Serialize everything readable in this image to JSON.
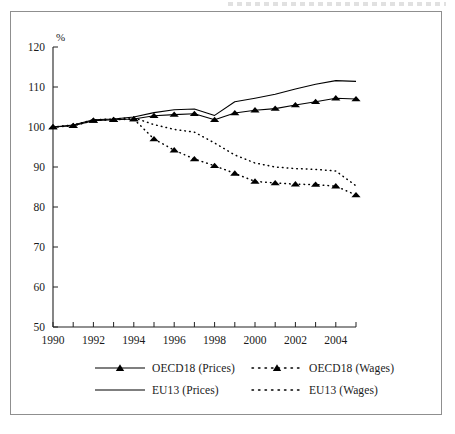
{
  "figure": {
    "y_axis_title": "%"
  },
  "chart_data": {
    "type": "line",
    "title": "",
    "xlabel": "",
    "ylabel": "%",
    "ylim": [
      50,
      120
    ],
    "yticks": [
      50,
      60,
      70,
      80,
      90,
      100,
      110,
      120
    ],
    "xlim": [
      1990,
      2005
    ],
    "xticks": [
      1990,
      1992,
      1994,
      1996,
      1998,
      2000,
      2002,
      2004
    ],
    "xticklabels": [
      "1990",
      "1992",
      "1994",
      "1996",
      "1998",
      "2000",
      "2002",
      "2004"
    ],
    "minor_xticks": [
      1991,
      1993,
      1995,
      1997,
      1999,
      2001,
      2003,
      2005
    ],
    "grid": false,
    "legend_position": "below-axes",
    "x": [
      1990,
      1991,
      1992,
      1993,
      1994,
      1995,
      1996,
      1997,
      1998,
      1999,
      2000,
      2001,
      2002,
      2003,
      2004,
      2005
    ],
    "series": [
      {
        "name": "OECD18 (Prices)",
        "style": "solid-with-markers",
        "marker": "triangle",
        "color": "#000000",
        "values": [
          100.0,
          100.3,
          101.6,
          101.8,
          102.0,
          102.8,
          103.1,
          103.3,
          101.8,
          103.5,
          104.2,
          104.6,
          105.5,
          106.3,
          107.2,
          107.0
        ]
      },
      {
        "name": "EU13 (Prices)",
        "style": "solid",
        "marker": "none",
        "color": "#000000",
        "values": [
          100.0,
          100.5,
          101.8,
          102.0,
          102.5,
          103.6,
          104.3,
          104.5,
          102.9,
          106.3,
          107.2,
          108.2,
          109.5,
          110.7,
          111.6,
          111.4
        ]
      },
      {
        "name": "OECD18 (Wages)",
        "style": "dotted-with-markers",
        "marker": "triangle",
        "color": "#000000",
        "values": [
          100.0,
          100.3,
          101.6,
          101.8,
          102.0,
          97.0,
          94.2,
          92.0,
          90.3,
          88.4,
          86.4,
          86.0,
          85.7,
          85.6,
          85.2,
          83.0
        ]
      },
      {
        "name": "EU13 (Wages)",
        "style": "dotted",
        "marker": "none",
        "color": "#000000",
        "values": [
          100.0,
          100.5,
          101.8,
          102.0,
          102.3,
          100.6,
          99.4,
          98.7,
          96.0,
          93.0,
          91.0,
          90.0,
          89.6,
          89.4,
          89.0,
          85.3
        ]
      }
    ]
  },
  "legend": {
    "items": [
      {
        "label": "OECD18 (Prices)",
        "style": "solid-with-markers"
      },
      {
        "label": "OECD18 (Wages)",
        "style": "dotted-with-markers"
      },
      {
        "label": "EU13 (Prices)",
        "style": "solid"
      },
      {
        "label": "EU13 (Wages)",
        "style": "dotted"
      }
    ]
  }
}
